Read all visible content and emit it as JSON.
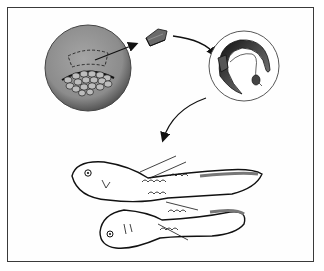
{
  "figure": {
    "panels": [
      {
        "id": "donor-embryo",
        "label": "Donor embryo with blastopore region"
      },
      {
        "id": "excised-tissue",
        "label": "Excised tissue fragment"
      },
      {
        "id": "host-embryo",
        "label": "Host embryo with graft"
      },
      {
        "id": "twin-larvae",
        "label": "Resulting conjoined twin larvae"
      }
    ],
    "colors": {
      "frame": "#3a3a3a",
      "donor_fill": "#8f8f8f",
      "ink": "#1a1a1a",
      "background": "#ffffff"
    }
  }
}
